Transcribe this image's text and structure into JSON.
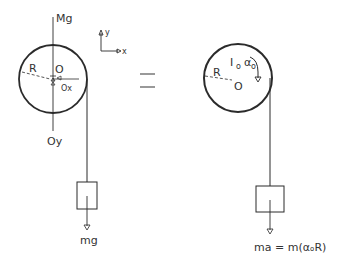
{
  "diagram": {
    "type": "free-body-equals-kinetic-diagram",
    "colors": {
      "ink": "#2b2b2b",
      "background": "#ffffff"
    },
    "left": {
      "title": "Free-body diagram",
      "labels": {
        "weight_pulley": "Mg",
        "radius": "R",
        "center": "O",
        "reaction_x": "Ox",
        "reaction_y": "Oy",
        "weight_block": "mg"
      }
    },
    "axes": {
      "x_label": "x",
      "y_label": "y"
    },
    "equals": "=",
    "right": {
      "title": "Kinetic diagram",
      "labels": {
        "radius": "R",
        "center": "O",
        "inertia": "Iₒαₒ",
        "inertia_I": "I",
        "inertia_sub": "o",
        "alpha": "α",
        "alpha_sub": "o",
        "equation": "ma = m(αₒR)"
      }
    }
  }
}
